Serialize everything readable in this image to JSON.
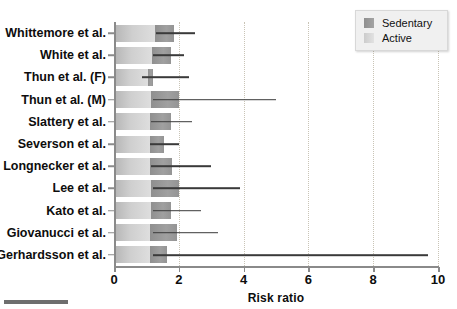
{
  "chart_data": {
    "type": "bar",
    "title": "",
    "xlabel": "Risk ratio",
    "ylabel": "",
    "xlim": [
      0,
      10
    ],
    "xticks": [
      0,
      2,
      4,
      6,
      8,
      10
    ],
    "xtick_labels": [
      "0",
      "2",
      "4",
      "6",
      "8",
      "10"
    ],
    "gridlines": {
      "vertical_at": [
        2,
        4,
        6,
        8,
        10
      ],
      "style": "dotted",
      "horizontal": false
    },
    "legend": {
      "position": "top-right",
      "entries": [
        {
          "label": "Sedentary",
          "color": "#9a9a9a"
        },
        {
          "label": "Active",
          "color": "#d8d8d8"
        }
      ]
    },
    "orientation": "horizontal",
    "categories": [
      "Whittemore et al.",
      "White et al.",
      "Thun et al. (F)",
      "Thun et al. (M)",
      "Slattery et al.",
      "Severson et al.",
      "Longnecker et al.",
      "Lee et al.",
      "Kato et al.",
      "Giovanucci et al.",
      "Gerhardsson et al."
    ],
    "series": [
      {
        "name": "Active",
        "color": "#d8d8d8",
        "values": [
          1.25,
          1.18,
          1.05,
          1.15,
          1.12,
          1.12,
          1.12,
          1.15,
          1.15,
          1.12,
          1.12
        ]
      },
      {
        "name": "Sedentary",
        "color": "#9a9a9a",
        "values": [
          1.85,
          1.75,
          1.2,
          2.0,
          1.75,
          1.55,
          1.8,
          2.0,
          1.75,
          1.95,
          1.65
        ]
      }
    ],
    "confidence_intervals": [
      {
        "category": "Whittemore et al.",
        "low": 1.3,
        "high": 2.5
      },
      {
        "category": "White et al.",
        "low": 1.2,
        "high": 2.15
      },
      {
        "category": "Thun et al. (F)",
        "low": 0.85,
        "high": 2.3
      },
      {
        "category": "Thun et al. (M)",
        "low": 1.2,
        "high": 5.0
      },
      {
        "category": "Slattery et al.",
        "low": 1.15,
        "high": 2.4
      },
      {
        "category": "Severson et al.",
        "low": 1.1,
        "high": 2.0
      },
      {
        "category": "Longnecker et al.",
        "low": 1.15,
        "high": 3.0
      },
      {
        "category": "Lee et al.",
        "low": 1.2,
        "high": 3.9
      },
      {
        "category": "Kato et al.",
        "low": 1.2,
        "high": 2.7
      },
      {
        "category": "Giovanucci et al.",
        "low": 1.2,
        "high": 3.2
      },
      {
        "category": "Gerhardsson et al.",
        "low": 1.2,
        "high": 9.7
      }
    ]
  }
}
